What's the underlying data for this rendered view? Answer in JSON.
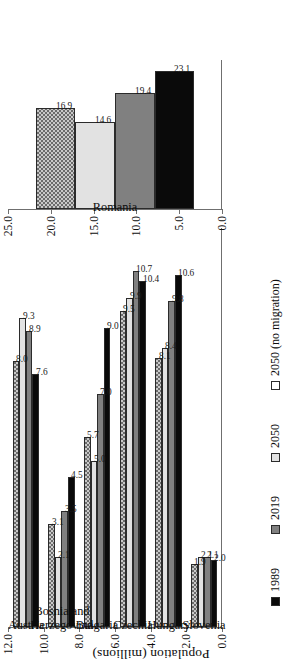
{
  "chart_data": {
    "type": "bar",
    "orientation": "vertical-grouped-rotated",
    "title": "",
    "xlabel": "",
    "ylabel": "Population (millions)",
    "grid": false,
    "legend_position": "bottom",
    "categories": [
      "Austria",
      "Bosnia and Herzegovina",
      "Bulgaria",
      "Czechia",
      "Hungary",
      "Slovenia",
      "Romania"
    ],
    "series": [
      {
        "name": "1989",
        "color": "#0a0a0a",
        "values": [
          7.6,
          4.5,
          9.0,
          10.4,
          10.6,
          2.0,
          23.1
        ]
      },
      {
        "name": "2019",
        "color": "#808080",
        "values": [
          8.9,
          3.5,
          7.0,
          10.7,
          9.8,
          2.1,
          19.4
        ]
      },
      {
        "name": "2050",
        "color": "#e2e2e2",
        "values": [
          9.3,
          2.1,
          5.0,
          9.9,
          8.4,
          2.1,
          14.6
        ]
      },
      {
        "name": "2050 (no migration)",
        "color": "#c9c9c9",
        "values": [
          8.0,
          3.1,
          5.7,
          9.5,
          8.1,
          1.9,
          16.9
        ]
      }
    ],
    "panels": [
      {
        "id": "main",
        "categories": [
          "Austria",
          "Bosnia and Herzegovina",
          "Bulgaria",
          "Czechia",
          "Hungary",
          "Slovenia"
        ],
        "ylim": [
          0.0,
          12.0
        ],
        "yticks": [
          "0.0",
          "2.0",
          "4.0",
          "6.0",
          "8.0",
          "10.0",
          "12.0"
        ]
      },
      {
        "id": "romania",
        "categories": [
          "Romania"
        ],
        "ylim": [
          0.0,
          25.0
        ],
        "yticks": [
          "0.0",
          "5.0",
          "10.0",
          "15.0",
          "20.0",
          "25.0"
        ]
      }
    ],
    "data_labels": {
      "Austria": [
        "7.6",
        "8.9",
        "9.3",
        "8.0"
      ],
      "Bosnia and Herzegovina": [
        "4.5",
        "3.5",
        "2.1",
        "3.1"
      ],
      "Bulgaria": [
        "9.0",
        "7.0",
        "5.0",
        "5.7"
      ],
      "Czechia": [
        "10.4",
        "10.7",
        "9.9",
        "9.5"
      ],
      "Hungary": [
        "10.6",
        "9.8",
        "8.4",
        "8.1"
      ],
      "Slovenia": [
        "2.0",
        "2.1",
        "2.1",
        "1.9"
      ],
      "Romania": [
        "23.1",
        "19.4",
        "14.6",
        "16.9"
      ]
    }
  },
  "legend": {
    "items": [
      {
        "label": "1989"
      },
      {
        "label": "2019"
      },
      {
        "label": "2050"
      },
      {
        "label": "2050 (no migration)"
      }
    ]
  },
  "axis": {
    "ylabel": "Population (millions)",
    "main_ticks": [
      "0.0",
      "2.0",
      "4.0",
      "6.0",
      "8.0",
      "10.0",
      "12.0"
    ],
    "romania_ticks": [
      "0.0",
      "5.0",
      "10.0",
      "15.0",
      "20.0",
      "25.0"
    ]
  }
}
